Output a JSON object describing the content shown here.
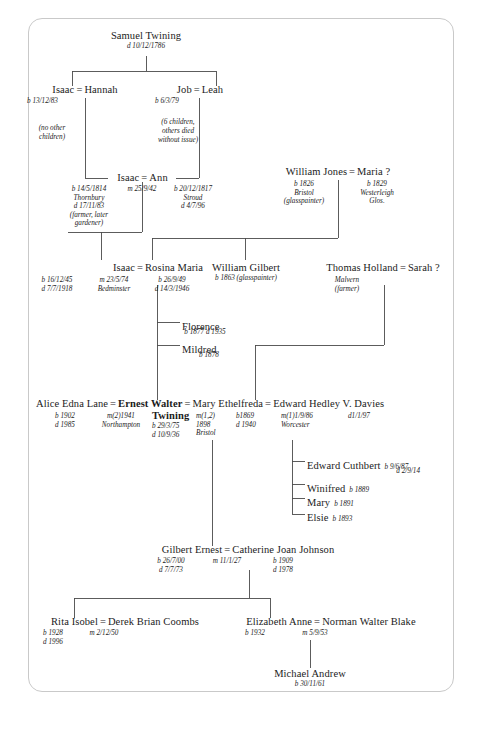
{
  "document": {
    "type": "genealogy-family-tree",
    "family": "Twining",
    "border_color": "#c9c9c9",
    "background": "#ffffff",
    "text_color": "#1b1b1b"
  },
  "people": {
    "samuel": {
      "name": "Samuel Twining",
      "dates": "d 10/12/1786"
    },
    "isaac1": {
      "name": "Isaac",
      "dates": "b 13/12/83"
    },
    "hannah": {
      "name": "Hannah",
      "note": "(no other\nchildren)",
      "note_l1": "(no other",
      "note_l2": "children)"
    },
    "job": {
      "name": "Job",
      "dates": "b 6/3/79"
    },
    "leah": {
      "name": "Leah",
      "note_l1": "(6 children,",
      "note_l2": "others died",
      "note_l3": "without issue)"
    },
    "isaac2": {
      "name": "Isaac",
      "d1": "b 14/5/1814",
      "d2": "Thornbury",
      "d3": "d 17/11/83",
      "d4": "(farmer, later",
      "d5": "gardener)"
    },
    "isaac2_marriage": "m 25/9/42",
    "ann": {
      "name": "Ann",
      "d1": "b 20/12/1817",
      "d2": "Stroud",
      "d3": "d 4/7/96"
    },
    "william_jones": {
      "name": "William Jones",
      "d1": "b 1826",
      "d2": "Bristol",
      "d3": "(glasspainter)"
    },
    "maria": {
      "name": "Maria ?",
      "d1": "b 1829",
      "d2": "Westerleigh",
      "d3": "Glos."
    },
    "isaac3": {
      "name": "Isaac",
      "d1": "b 16/12/45",
      "d2": "d 7/7/1918"
    },
    "isaac3_marriage": {
      "d1": "m 23/5/74",
      "d2": "Bedminster"
    },
    "rosina": {
      "name": "Rosina Maria",
      "d1": "b 26/9/49",
      "d2": "d 14/3/1946"
    },
    "william_gilbert": {
      "name": "William Gilbert",
      "dates": "b 1863 (glasspainter)"
    },
    "thomas_holland": {
      "name": "Thomas Holland",
      "d1": "Malvern",
      "d2": "(farmer)"
    },
    "sarah": {
      "name": "Sarah ?"
    },
    "florence": {
      "name": "Florence",
      "dates": "b 1877  d 1935"
    },
    "mildred": {
      "name": "Mildred",
      "dates": "b 1878"
    },
    "alice": {
      "name": "Alice Edna Lane",
      "d1": "b 1902",
      "d2": "d 1985"
    },
    "alice_marriage": {
      "d1": "m(2)1941",
      "d2": "Northampton"
    },
    "ernest": {
      "name_l1": "Ernest Walter",
      "name_l2": "Twining",
      "d1": "b 29/3/75",
      "d2": "d 10/9/36"
    },
    "ernest_marriage": {
      "d1": "m(1,2)",
      "d2": "1898",
      "d3": "Bristol"
    },
    "mary_ethelfreda": {
      "name": "Mary Ethelfreda",
      "d1": "b1869",
      "d2": "d 1940"
    },
    "mary_marriage": {
      "d1": "m(1)1/9/86",
      "d2": "Worcester"
    },
    "edward_davies": {
      "name": "Edward Hedley V. Davies",
      "d1": "d1/1/97"
    },
    "edward_cuthbert": {
      "name": "Edward Cuthbert",
      "d1": "b 9/6/87",
      "d2": "d 2/9/14"
    },
    "winifred": {
      "name": "Winifred",
      "dates": "b 1889"
    },
    "mary_d": {
      "name": "Mary",
      "dates": "b 1891"
    },
    "elsie": {
      "name": "Elsie",
      "dates": "b 1893"
    },
    "gilbert_ernest": {
      "name": "Gilbert Ernest",
      "d1": "b 26/7/00",
      "d2": "d 7/7/73"
    },
    "gilbert_marriage": {
      "d1": "m 11/1/27"
    },
    "catherine": {
      "name": "Catherine Joan Johnson",
      "d1": "b 1909",
      "d2": "d 1978"
    },
    "rita": {
      "name": "Rita Isobel",
      "d1": "b 1928",
      "d2": "d 1996"
    },
    "rita_marriage": {
      "d1": "m 2/12/50"
    },
    "derek": {
      "name": "Derek Brian Coombs"
    },
    "elizabeth": {
      "name": "Elizabeth Anne",
      "d1": "b 1932"
    },
    "elizabeth_marriage": {
      "d1": "m 5/9/53"
    },
    "norman": {
      "name": "Norman Walter Blake"
    },
    "michael": {
      "name": "Michael Andrew",
      "dates": "b 30/11/61"
    }
  },
  "symbols": {
    "marriage": "="
  }
}
